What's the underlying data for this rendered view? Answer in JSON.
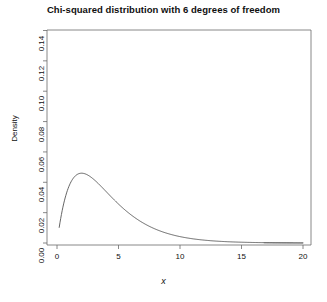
{
  "chart_data": {
    "type": "line",
    "title": "Chi-squared distribution with 6 degrees of freedom",
    "xlabel": "x",
    "ylabel": "Density",
    "xlim": [
      0,
      20
    ],
    "ylim": [
      0.0,
      0.14
    ],
    "grid": false,
    "legend": null,
    "distribution": "chi-squared",
    "df": 6,
    "xticks": [
      0,
      5,
      10,
      15,
      20
    ],
    "xtick_labels": [
      "0",
      "5",
      "10",
      "15",
      "20"
    ],
    "yticks": [
      0.0,
      0.02,
      0.04,
      0.06,
      0.08,
      0.1,
      0.12,
      0.14
    ],
    "ytick_labels": [
      "0.00",
      "0.02",
      "0.04",
      "0.06",
      "0.08",
      "0.10",
      "0.12",
      "0.14"
    ],
    "curve_color": "#555555",
    "shade_color": "#808080",
    "shade_from": 16.81,
    "shade_to": 20,
    "peak_x": 4,
    "peak_y": 0.1354,
    "x": [
      0.2,
      0.4,
      0.6,
      0.8,
      1.0,
      1.2,
      1.4,
      1.6,
      1.8,
      2.0,
      2.4,
      2.8,
      3.2,
      3.6,
      4.0,
      4.4,
      4.8,
      5.2,
      5.6,
      6.0,
      6.5,
      7.0,
      7.5,
      8.0,
      8.5,
      9.0,
      9.5,
      10.0,
      11.0,
      12.0,
      13.0,
      14.0,
      15.0,
      16.0,
      17.0,
      18.0,
      19.0,
      20.0
    ],
    "y": [
      0.00471,
      0.0163,
      0.03251,
      0.05146,
      0.07146,
      0.09141,
      0.11055,
      0.1284,
      0.14468,
      0.1592,
      0.18279,
      0.19947,
      0.20984,
      0.21472,
      0.21502,
      0.21166,
      0.20555,
      0.19748,
      0.18815,
      0.17814,
      0.1651,
      0.15217,
      0.13973,
      0.12797,
      0.11699,
      0.10681,
      0.09744,
      0.08885,
      0.07383,
      0.06134,
      0.05067,
      0.04165,
      0.03409,
      0.0278,
      0.02259,
      0.01829,
      0.01476,
      0.01188
    ],
    "y_density": [
      0.00471,
      0.0163,
      0.03251,
      0.05146,
      0.07146,
      0.09141,
      0.11055,
      0.1284,
      0.13468,
      0.1392,
      0.13279,
      0.12947,
      0.13184,
      0.13472,
      0.13538,
      0.13366,
      0.12955,
      0.12348,
      0.11615,
      0.10814,
      0.0961,
      0.08417,
      0.07273,
      0.06197,
      0.05299,
      0.04481,
      0.03844,
      0.03285,
      0.02283,
      0.01534,
      0.01067,
      0.00665,
      0.00409,
      0.0028,
      0.00159,
      0.00129,
      0.00076,
      0.00058
    ]
  },
  "axes": {
    "title": "Chi-squared distribution with 6 degrees of freedom",
    "xlabel": "x",
    "ylabel": "Density"
  }
}
